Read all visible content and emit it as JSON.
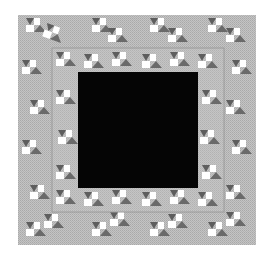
{
  "figure": {
    "colors": {
      "background": "#ffffff",
      "ring_gray": "#b8b8b8",
      "ring_light": "#cfcfcf",
      "triangle_dark": "#6a6a6a",
      "triangle_white": "#ffffff",
      "center": "#050505"
    },
    "outer_square": {
      "x": 18,
      "y": 15,
      "w": 238,
      "h": 230
    },
    "inner_ring": {
      "x": 52,
      "y": 48,
      "w": 172,
      "h": 164
    },
    "center_square": {
      "x": 78,
      "y": 72,
      "w": 120,
      "h": 116
    }
  }
}
